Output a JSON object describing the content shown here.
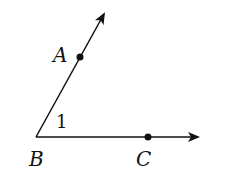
{
  "diagram": {
    "type": "angle",
    "vertex": {
      "label": "B",
      "x": 36,
      "y": 137
    },
    "rays": [
      {
        "name": "ray-BA",
        "from": "B",
        "through": "A",
        "end": {
          "x": 105,
          "y": 12
        }
      },
      {
        "name": "ray-BC",
        "from": "B",
        "through": "C",
        "end": {
          "x": 198,
          "y": 137
        }
      }
    ],
    "points": [
      {
        "label": "A",
        "x": 80,
        "y": 57
      },
      {
        "label": "C",
        "x": 148,
        "y": 137
      }
    ],
    "labels": {
      "A": "A",
      "B": "B",
      "C": "C",
      "angle": "1"
    },
    "colors": {
      "stroke": "#111111",
      "background": "#ffffff"
    }
  }
}
